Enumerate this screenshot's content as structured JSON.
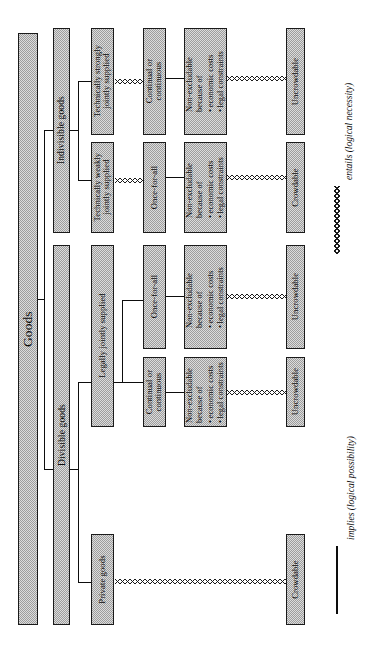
{
  "diagram": {
    "orientation": "rotated-90-ccw",
    "colors": {
      "box_fill": "#d0d0d0",
      "box_border": "#1a1a1a",
      "line": "#0d0d0d"
    },
    "root": {
      "label": "Goods"
    },
    "level2": [
      {
        "id": "indivisible",
        "label": "Indivisible goods"
      },
      {
        "id": "divisible",
        "label": "Divisible goods"
      }
    ],
    "level3": [
      {
        "id": "tech-strong",
        "label": "Technically strongly\njointly supplied"
      },
      {
        "id": "tech-weak",
        "label": "Technically weakly\njointly supplied"
      },
      {
        "id": "legally-joint",
        "label": "Legally jointly supplied"
      },
      {
        "id": "private",
        "label": "Private goods"
      }
    ],
    "level4": [
      {
        "id": "cont-1",
        "label": "Continual or\ncontinuous"
      },
      {
        "id": "once-1",
        "label": "Once-for-all"
      },
      {
        "id": "once-2",
        "label": "Once-for-all"
      },
      {
        "id": "cont-2",
        "label": "Continual or\ncontinuous"
      }
    ],
    "level5": {
      "line1": "Non-excludable",
      "line2": "because of",
      "bullets": [
        "economic costs",
        "legal constraints"
      ],
      "count": 4
    },
    "level6": [
      {
        "id": "uncrowd-1",
        "label": "Uncrowdable"
      },
      {
        "id": "crowd-1",
        "label": "Crowdable"
      },
      {
        "id": "uncrowd-2",
        "label": "Uncrowdable"
      },
      {
        "id": "uncrowd-3",
        "label": "Uncrowdable"
      },
      {
        "id": "crowd-2",
        "label": "Crowdable"
      }
    ]
  },
  "legend": {
    "entails": {
      "label": "entails  (logical  necessity)",
      "style": "zigzag"
    },
    "implies": {
      "label": "implies  (logical  possibility)",
      "style": "solid"
    }
  }
}
